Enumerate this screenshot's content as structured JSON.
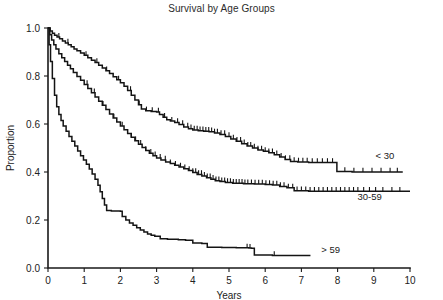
{
  "chart_data": {
    "type": "line",
    "title": "Survival by Age Groups",
    "xlabel": "Years",
    "ylabel": "Proportion",
    "xlim": [
      0,
      10
    ],
    "ylim": [
      0.0,
      1.0
    ],
    "xticks": [
      0,
      1,
      2,
      3,
      4,
      5,
      6,
      7,
      8,
      9,
      10
    ],
    "xtick_labels": [
      "0",
      "1",
      "2",
      "3",
      "4",
      "5",
      "6",
      "7",
      "8",
      "9",
      "10"
    ],
    "yticks": [
      0.0,
      0.2,
      0.4,
      0.6,
      0.8,
      1.0
    ],
    "ytick_labels": [
      "0.0",
      "0.2",
      "0.4",
      "0.6",
      "0.8",
      "1.0"
    ],
    "grid": false,
    "legend_position": "inline-right-of-curve",
    "curve_style": "kaplan-meier-step-with-censor-ticks",
    "series": [
      {
        "name": "< 30",
        "label": "< 30",
        "color": "#141414",
        "label_x": 9.05,
        "label_y": 0.455,
        "points": [
          [
            0.0,
            1.0
          ],
          [
            0.06,
            0.988
          ],
          [
            0.12,
            0.978
          ],
          [
            0.18,
            0.97
          ],
          [
            0.25,
            0.962
          ],
          [
            0.32,
            0.955
          ],
          [
            0.4,
            0.946
          ],
          [
            0.48,
            0.938
          ],
          [
            0.56,
            0.93
          ],
          [
            0.64,
            0.922
          ],
          [
            0.72,
            0.913
          ],
          [
            0.8,
            0.905
          ],
          [
            0.9,
            0.896
          ],
          [
            1.0,
            0.886
          ],
          [
            1.1,
            0.876
          ],
          [
            1.2,
            0.866
          ],
          [
            1.3,
            0.856
          ],
          [
            1.4,
            0.845
          ],
          [
            1.5,
            0.833
          ],
          [
            1.6,
            0.822
          ],
          [
            1.7,
            0.81
          ],
          [
            1.8,
            0.797
          ],
          [
            1.9,
            0.784
          ],
          [
            2.0,
            0.772
          ],
          [
            2.1,
            0.757
          ],
          [
            2.2,
            0.74
          ],
          [
            2.3,
            0.72
          ],
          [
            2.4,
            0.7
          ],
          [
            2.5,
            0.68
          ],
          [
            2.58,
            0.663
          ],
          [
            2.7,
            0.655
          ],
          [
            2.85,
            0.652
          ],
          [
            3.0,
            0.65
          ],
          [
            3.08,
            0.64
          ],
          [
            3.18,
            0.628
          ],
          [
            3.28,
            0.618
          ],
          [
            3.38,
            0.612
          ],
          [
            3.5,
            0.606
          ],
          [
            3.62,
            0.598
          ],
          [
            3.75,
            0.588
          ],
          [
            3.88,
            0.58
          ],
          [
            4.0,
            0.575
          ],
          [
            4.15,
            0.572
          ],
          [
            4.3,
            0.57
          ],
          [
            4.45,
            0.568
          ],
          [
            4.6,
            0.563
          ],
          [
            4.75,
            0.556
          ],
          [
            4.9,
            0.548
          ],
          [
            5.05,
            0.538
          ],
          [
            5.2,
            0.528
          ],
          [
            5.35,
            0.518
          ],
          [
            5.5,
            0.508
          ],
          [
            5.65,
            0.5
          ],
          [
            5.8,
            0.492
          ],
          [
            5.95,
            0.486
          ],
          [
            6.1,
            0.48
          ],
          [
            6.25,
            0.472
          ],
          [
            6.4,
            0.462
          ],
          [
            6.55,
            0.452
          ],
          [
            6.7,
            0.444
          ],
          [
            6.9,
            0.442
          ],
          [
            7.2,
            0.44
          ],
          [
            7.6,
            0.44
          ],
          [
            7.95,
            0.44
          ],
          [
            7.98,
            0.402
          ],
          [
            8.4,
            0.4
          ],
          [
            9.0,
            0.4
          ],
          [
            9.8,
            0.4
          ]
        ],
        "censor_times": [
          0.3,
          0.55,
          1.05,
          1.35,
          1.62,
          1.95,
          2.28,
          2.52,
          2.72,
          2.88,
          3.05,
          3.22,
          3.42,
          3.58,
          3.72,
          3.86,
          3.95,
          4.04,
          4.12,
          4.2,
          4.28,
          4.36,
          4.44,
          4.52,
          4.6,
          4.68,
          4.78,
          4.88,
          5.0,
          5.12,
          5.22,
          5.32,
          5.42,
          5.52,
          5.6,
          5.7,
          5.8,
          5.9,
          6.0,
          6.1,
          6.2,
          6.32,
          6.44,
          6.56,
          6.68,
          6.8,
          6.92,
          7.04,
          7.16,
          7.3,
          7.44,
          7.58,
          7.72,
          7.86,
          8.2,
          8.45,
          8.7,
          8.95,
          9.2,
          9.45,
          9.65
        ]
      },
      {
        "name": "30-59",
        "label": "30-59",
        "color": "#141414",
        "label_x": 8.55,
        "label_y": 0.285,
        "points": [
          [
            0.0,
            1.0
          ],
          [
            0.05,
            0.972
          ],
          [
            0.1,
            0.95
          ],
          [
            0.16,
            0.93
          ],
          [
            0.22,
            0.912
          ],
          [
            0.3,
            0.893
          ],
          [
            0.38,
            0.876
          ],
          [
            0.46,
            0.86
          ],
          [
            0.54,
            0.845
          ],
          [
            0.62,
            0.83
          ],
          [
            0.7,
            0.815
          ],
          [
            0.8,
            0.798
          ],
          [
            0.9,
            0.782
          ],
          [
            1.0,
            0.765
          ],
          [
            1.1,
            0.748
          ],
          [
            1.2,
            0.73
          ],
          [
            1.3,
            0.712
          ],
          [
            1.4,
            0.695
          ],
          [
            1.5,
            0.678
          ],
          [
            1.6,
            0.66
          ],
          [
            1.7,
            0.642
          ],
          [
            1.8,
            0.625
          ],
          [
            1.9,
            0.608
          ],
          [
            2.0,
            0.592
          ],
          [
            2.1,
            0.576
          ],
          [
            2.2,
            0.56
          ],
          [
            2.3,
            0.545
          ],
          [
            2.4,
            0.53
          ],
          [
            2.5,
            0.516
          ],
          [
            2.6,
            0.502
          ],
          [
            2.7,
            0.49
          ],
          [
            2.8,
            0.478
          ],
          [
            2.9,
            0.468
          ],
          [
            3.0,
            0.458
          ],
          [
            3.12,
            0.45
          ],
          [
            3.25,
            0.442
          ],
          [
            3.38,
            0.435
          ],
          [
            3.5,
            0.428
          ],
          [
            3.62,
            0.421
          ],
          [
            3.75,
            0.414
          ],
          [
            3.88,
            0.406
          ],
          [
            4.0,
            0.398
          ],
          [
            4.12,
            0.39
          ],
          [
            4.25,
            0.383
          ],
          [
            4.38,
            0.376
          ],
          [
            4.5,
            0.37
          ],
          [
            4.62,
            0.364
          ],
          [
            4.75,
            0.36
          ],
          [
            4.9,
            0.356
          ],
          [
            5.1,
            0.353
          ],
          [
            5.4,
            0.351
          ],
          [
            5.7,
            0.35
          ],
          [
            6.0,
            0.348
          ],
          [
            6.2,
            0.346
          ],
          [
            6.4,
            0.34
          ],
          [
            6.6,
            0.334
          ],
          [
            6.8,
            0.322
          ],
          [
            7.2,
            0.32
          ],
          [
            7.8,
            0.32
          ],
          [
            8.5,
            0.32
          ],
          [
            9.3,
            0.32
          ],
          [
            10.0,
            0.32
          ]
        ],
        "censor_times": [
          1.08,
          1.28,
          1.52,
          1.82,
          2.05,
          2.3,
          2.42,
          2.56,
          2.7,
          2.84,
          2.96,
          3.1,
          3.24,
          3.38,
          3.52,
          3.66,
          3.78,
          3.9,
          4.0,
          4.08,
          4.16,
          4.24,
          4.32,
          4.4,
          4.48,
          4.56,
          4.64,
          4.72,
          4.8,
          4.88,
          4.96,
          5.04,
          5.12,
          5.2,
          5.28,
          5.36,
          5.44,
          5.52,
          5.62,
          5.72,
          5.82,
          5.92,
          6.02,
          6.12,
          6.22,
          6.32,
          6.42,
          6.52,
          6.64,
          6.76,
          6.88,
          7.0,
          7.12,
          7.24,
          7.36,
          7.48,
          7.6,
          7.72,
          7.84,
          7.96,
          8.08,
          8.2,
          8.32,
          8.44,
          8.56,
          8.72,
          8.88,
          9.05,
          9.25,
          9.5,
          9.72
        ]
      },
      {
        "name": "> 59",
        "label": "> 59",
        "color": "#141414",
        "label_x": 7.55,
        "label_y": 0.062,
        "points": [
          [
            0.0,
            1.0
          ],
          [
            0.03,
            0.93
          ],
          [
            0.07,
            0.86
          ],
          [
            0.12,
            0.79
          ],
          [
            0.18,
            0.72
          ],
          [
            0.24,
            0.672
          ],
          [
            0.3,
            0.64
          ],
          [
            0.36,
            0.615
          ],
          [
            0.42,
            0.592
          ],
          [
            0.5,
            0.57
          ],
          [
            0.58,
            0.548
          ],
          [
            0.66,
            0.528
          ],
          [
            0.74,
            0.508
          ],
          [
            0.82,
            0.488
          ],
          [
            0.9,
            0.468
          ],
          [
            0.98,
            0.45
          ],
          [
            1.06,
            0.432
          ],
          [
            1.14,
            0.412
          ],
          [
            1.22,
            0.392
          ],
          [
            1.3,
            0.37
          ],
          [
            1.38,
            0.345
          ],
          [
            1.44,
            0.318
          ],
          [
            1.5,
            0.29
          ],
          [
            1.56,
            0.262
          ],
          [
            1.62,
            0.24
          ],
          [
            1.75,
            0.238
          ],
          [
            1.9,
            0.237
          ],
          [
            2.0,
            0.236
          ],
          [
            2.05,
            0.215
          ],
          [
            2.15,
            0.2
          ],
          [
            2.25,
            0.188
          ],
          [
            2.35,
            0.178
          ],
          [
            2.45,
            0.168
          ],
          [
            2.55,
            0.158
          ],
          [
            2.65,
            0.15
          ],
          [
            2.75,
            0.142
          ],
          [
            2.85,
            0.136
          ],
          [
            2.95,
            0.132
          ],
          [
            3.1,
            0.122
          ],
          [
            3.3,
            0.12
          ],
          [
            3.6,
            0.118
          ],
          [
            3.8,
            0.116
          ],
          [
            4.0,
            0.104
          ],
          [
            4.25,
            0.102
          ],
          [
            4.4,
            0.086
          ],
          [
            4.8,
            0.085
          ],
          [
            5.2,
            0.084
          ],
          [
            5.55,
            0.083
          ],
          [
            5.62,
            0.082
          ],
          [
            5.7,
            0.054
          ],
          [
            6.2,
            0.052
          ],
          [
            6.7,
            0.052
          ],
          [
            7.25,
            0.052
          ]
        ],
        "censor_times": [
          5.5,
          5.58,
          6.25
        ]
      }
    ]
  }
}
